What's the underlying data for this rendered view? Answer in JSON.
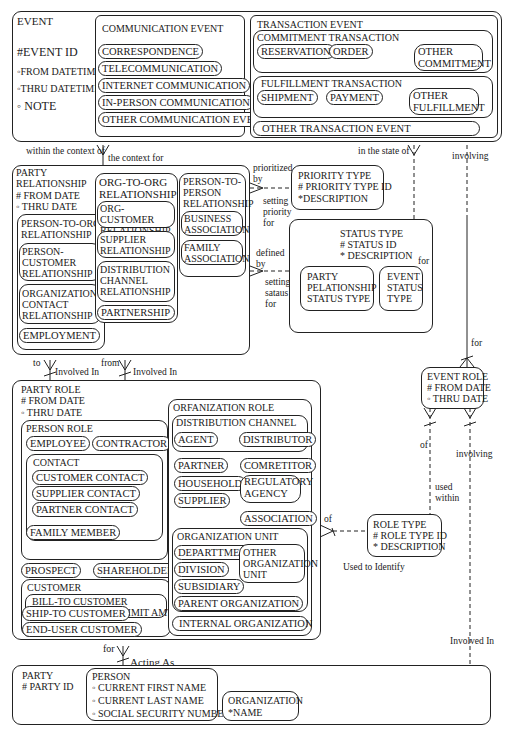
{
  "event": {
    "title": "EVENT",
    "attributes": [
      "#EVENT ID",
      "◦FROM DATETIME",
      "◦THRU DATETIME",
      "◦ NOTE"
    ],
    "communication_event": {
      "title": "COMMUNICATION EVENT",
      "subtypes": [
        "CORRESPONDENCE",
        "TELECOMMUNICATION",
        "INTERNET COMMUNICATION",
        "IN-PERSON COMMUNICATION",
        "OTHER COMMUNICATION EVENT"
      ]
    },
    "transaction_event": {
      "title": "TRANSACTION EVENT",
      "commitment": {
        "title": "COMMITMENT TRANSACTION",
        "subtypes": [
          "RESERVATION",
          "ORDER",
          "OTHER COMMITMENT"
        ]
      },
      "fulfillment": {
        "title": "FULFILLMENT TRANSACTION",
        "subtypes": [
          "SHIPMENT",
          "PAYMENT",
          "OTHER FULFILLMENT"
        ]
      },
      "other": "OTHER TRANSACTION EVENT"
    }
  },
  "party_relationship": {
    "title": "PARTY RELATIONSHIP",
    "attributes": [
      "# FROM DATE",
      "◦ THRU DATE"
    ],
    "person_to_org": {
      "title": "PERSON-TO-ORG RELATIONSHIP",
      "subtypes": [
        "PERSON-CUSTOMER RELATIONSHIP",
        "ORGANIZATION CONTACT RELATIONSHIP",
        "EMPLOYMENT"
      ]
    },
    "org_to_org": {
      "title": "ORG-TO-ORG RELATIONSHIP",
      "subtypes": [
        "ORG-CUSTOMER RELATIONSHIP",
        "SUPPLIER RELATIONSHIP",
        "DISTRIBUTION CHANNEL RELATIONSHIP",
        "PARTNERSHIP"
      ]
    },
    "person_to_person": {
      "title": "PERSON-TO-PERSON RELATIONSHIP",
      "subtypes": [
        "BUSINESS ASSOCIATION",
        "FAMILY ASSOCIATION"
      ]
    }
  },
  "priority_type": {
    "title": "PRIORITY TYPE",
    "attributes": [
      "# PRIORITY TYPE ID",
      "*DESCRIPTION"
    ]
  },
  "status_type": {
    "title": "STATUS TYPE",
    "attributes": [
      "# STATUS ID",
      "* DESCRIPTION"
    ],
    "subtypes": [
      "PARTY PELATIONSHIP STATUS TYPE",
      "EVENT STATUS TYPE"
    ]
  },
  "event_role": {
    "title": "EVENT ROLE",
    "attributes": [
      "# FROM DATE",
      "◦ THRU DATE"
    ]
  },
  "role_type": {
    "title": "ROLE TYPE",
    "attributes": [
      "# ROLE TYPE ID",
      "* DESCRIPTION"
    ]
  },
  "party_role": {
    "title": "PARTY ROLE",
    "attributes": [
      "# FROM DATE",
      "◦ THRU DATE"
    ],
    "person_role": {
      "title": "PERSON ROLE",
      "employee": "EMPLOYEE",
      "contractor": "CONTRACTOR",
      "contact": {
        "title": "CONTACT",
        "subtypes": [
          "CUSTOMER CONTACT",
          "SUPPLIER CONTACT",
          "PARTNER CONTACT"
        ]
      },
      "family_member": "FAMILY MEMBER"
    },
    "prospect": "PROSPECT",
    "shareholder": "SHAREHOLDER",
    "customer": {
      "title": "CUSTOMER",
      "bill_to": "BILL-TO CUSTOMER",
      "bill_to_attr": "◦ CURRENT CREDIT LIMIT AMT",
      "ship_to": "SHIP-TO CUSTOMER",
      "end_user": "END-USER CUSTOMER"
    },
    "organization_role": {
      "title": "ORFANIZATION ROLE",
      "distribution_channel": {
        "title": "DISTRIBUTION CHANNEL",
        "subtypes": [
          "AGENT",
          "DISTRIBUTOR"
        ]
      },
      "others": [
        "PARTNER",
        "COMRETITOR",
        "HOUSEHOLD",
        "REGULATORY AGENCY",
        "SUPPLIER",
        "ASSOCIATION"
      ],
      "organization_unit": {
        "title": "ORGANIZATION UNIT",
        "subtypes": [
          "DEPARTTMENT",
          "DIVISION",
          "SUBSIDIARY",
          "OTHER ORGANIZATION UNIT",
          "PARENT ORGANIZATION"
        ]
      },
      "internal_organization": "INTERNAL ORGANIZATION"
    }
  },
  "party": {
    "title": "PARTY",
    "attributes": [
      "# PARTY ID"
    ],
    "person": {
      "title": "PERSON",
      "attributes": [
        "◦ CURRENT FIRST NAME",
        "◦ CURRENT LAST NAME",
        "◦ SOCIAL SECURITY NUMBER"
      ]
    },
    "organization": {
      "title": "ORGANIZATION",
      "attributes": [
        "*NAME"
      ]
    }
  },
  "relationship_labels": {
    "within_context_of": "within the context of",
    "context_for": "the context for",
    "in_state_of": "in the state of",
    "involving_top": "involving",
    "prioritized_by": "prioritized by",
    "setting_priority_for": "setting priority for",
    "defined_by": "defined by",
    "setting_status_for": "setting sataus for",
    "for_status": "for",
    "for_event_role": "for",
    "to": "to",
    "from": "from",
    "involved_in_1": "Involved In",
    "involved_in_2": "Involved In",
    "of_event_role": "of",
    "involving_event_role": "involving",
    "used_within": "used within",
    "of_role_type": "of",
    "used_to_identify": "Used to Identify",
    "for_party": "for",
    "acting_as": "Acting As",
    "involved_in_party": "Involved In"
  }
}
